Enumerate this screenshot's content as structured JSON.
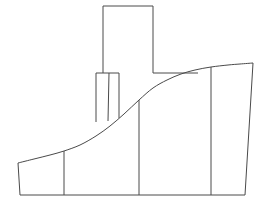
{
  "figure": {
    "type": "technical-line-drawing",
    "canvas": {
      "width": 271,
      "height": 211,
      "background": "#ffffff"
    },
    "stroke_color": "#4a4a4a",
    "fill_color": "#ffffff",
    "stroke_width": 1
  },
  "chart_data": {
    "type": "line",
    "xlabel": "",
    "ylabel": "",
    "xlim": [
      0,
      271
    ],
    "ylim": [
      211,
      0
    ],
    "grid": false,
    "legend": "none",
    "series": [
      {
        "name": "base-outline",
        "description": "Outer ground and right flank boundary of the profile",
        "points": [
          [
            18,
            163
          ],
          [
            20,
            195
          ],
          [
            245,
            195
          ],
          [
            253,
            63
          ]
        ]
      },
      {
        "name": "profile-curve",
        "description": "S-shaped upper silhouette rising left to right",
        "points": [
          [
            18,
            163
          ],
          [
            34,
            159
          ],
          [
            50,
            155
          ],
          [
            64,
            151
          ],
          [
            80,
            145
          ],
          [
            96,
            136
          ],
          [
            110,
            126
          ],
          [
            124,
            114
          ],
          [
            139,
            100
          ],
          [
            153,
            88
          ],
          [
            167,
            80
          ],
          [
            181,
            74
          ],
          [
            195,
            70
          ],
          [
            211,
            67
          ],
          [
            228,
            65
          ],
          [
            240,
            64
          ],
          [
            253,
            63
          ]
        ]
      },
      {
        "name": "tall-tower",
        "description": "Tall upper rectangular tower / chimney",
        "points": [
          [
            103,
            73
          ],
          [
            103,
            6
          ],
          [
            153,
            6
          ],
          [
            153,
            73
          ]
        ]
      },
      {
        "name": "small-tower",
        "description": "Short secondary tower overlapping the tall tower base",
        "points": [
          [
            96,
            122
          ],
          [
            96,
            73
          ],
          [
            119,
            73
          ],
          [
            119,
            118
          ]
        ]
      },
      {
        "name": "small-tower-inner-edge",
        "description": "Inner vertical edge of the short tower",
        "points": [
          [
            109,
            73
          ],
          [
            108,
            121
          ]
        ]
      },
      {
        "name": "deck-line",
        "description": "Horizontal deck line at the tall tower base",
        "points": [
          [
            153,
            73
          ],
          [
            198,
            73
          ]
        ]
      },
      {
        "name": "division-line-1",
        "description": "Leftmost vertical division line",
        "points": [
          [
            64,
            151
          ],
          [
            64,
            195
          ]
        ]
      },
      {
        "name": "division-line-2",
        "description": "Center vertical division line",
        "points": [
          [
            139,
            100
          ],
          [
            139,
            195
          ]
        ]
      },
      {
        "name": "division-line-3",
        "description": "Right vertical division line",
        "points": [
          [
            211,
            67
          ],
          [
            211,
            195
          ]
        ]
      }
    ],
    "annotations": [],
    "tick_labels": {
      "x": [],
      "y": []
    }
  }
}
